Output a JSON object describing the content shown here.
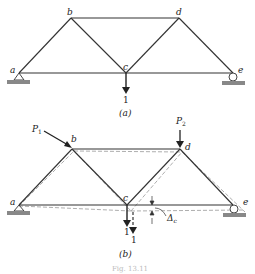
{
  "figure_a": {
    "nodes": {
      "a": "a",
      "b": "b",
      "c": "c",
      "d": "d",
      "e": "e"
    },
    "load_label": "1",
    "caption": "(a)"
  },
  "figure_b": {
    "nodes": {
      "a": "a",
      "b": "b",
      "c": "c",
      "d": "d",
      "e": "e"
    },
    "force1": "P",
    "force1_sub": "1",
    "force2": "P",
    "force2_sub": "2",
    "load_label_1": "1",
    "load_label_2": "1",
    "deflection_label": "Δ",
    "deflection_sub": "c",
    "caption": "(b)"
  },
  "figure_caption": "Fig. 13.11"
}
